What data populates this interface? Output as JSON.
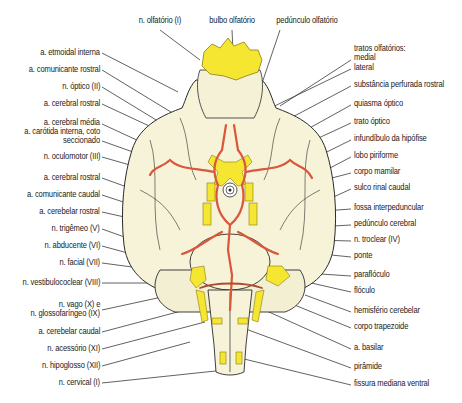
{
  "diagram": {
    "colors": {
      "brain_fill": "#f7f3d9",
      "outline": "#2a2a2a",
      "nerve_yellow": "#f5e632",
      "artery_red": "#d9573a",
      "leader_line": "#333333"
    },
    "top_labels": [
      {
        "text": "n. olfatório (I)",
        "x": 160,
        "y": 22
      },
      {
        "text": "bulbo olfatório",
        "x": 232,
        "y": 22
      },
      {
        "text": "pedúnculo olfatório",
        "x": 307,
        "y": 22
      }
    ],
    "left_labels": [
      {
        "text": "a. etmoidal interna",
        "y": 52
      },
      {
        "text": "a. comunicante rostral",
        "y": 69
      },
      {
        "text": "n. óptico (II)",
        "y": 86
      },
      {
        "text": "a. cerebral rostral",
        "y": 103
      },
      {
        "text": "a. cerebral média",
        "y": 122
      },
      {
        "text": "a. carótida interna, coto",
        "y": 131
      },
      {
        "text": "seccionado",
        "y": 140
      },
      {
        "text": "n. oculomotor (III)",
        "y": 156
      },
      {
        "text": "a. cerebral rostral",
        "y": 177
      },
      {
        "text": "a. comunicante caudal",
        "y": 194
      },
      {
        "text": "a. cerebelar rostral",
        "y": 211
      },
      {
        "text": "n. trigêmeo (V)",
        "y": 228
      },
      {
        "text": "n. abducente (VI)",
        "y": 245
      },
      {
        "text": "n. facial (VII)",
        "y": 262
      },
      {
        "text": "n. vestibulococlear (VIII)",
        "y": 282
      },
      {
        "text": "n. vago (X) e",
        "y": 304
      },
      {
        "text": "n. glossofaríngeo (IX)",
        "y": 313
      },
      {
        "text": "a. cerebelar caudal",
        "y": 331
      },
      {
        "text": "n. acessório (XI)",
        "y": 348
      },
      {
        "text": "n. hipoglosso (XII)",
        "y": 365
      },
      {
        "text": "n. cervical (I)",
        "y": 382
      }
    ],
    "right_labels": [
      {
        "text": "tratos olfatórios:",
        "y": 48
      },
      {
        "text": "medial",
        "y": 57
      },
      {
        "text": "lateral",
        "y": 67
      },
      {
        "text": "substância perfurada rostral",
        "y": 84
      },
      {
        "text": "quiasma óptico",
        "y": 103
      },
      {
        "text": "trato óptico",
        "y": 121
      },
      {
        "text": "infundíbulo da hipófise",
        "y": 138
      },
      {
        "text": "lobo piriforme",
        "y": 155
      },
      {
        "text": "corpo mamilar",
        "y": 171
      },
      {
        "text": "sulco rinal caudal",
        "y": 187
      },
      {
        "text": "fossa interpeduncular",
        "y": 207
      },
      {
        "text": "pedúnculo cerebral",
        "y": 223
      },
      {
        "text": "n. troclear (IV)",
        "y": 239
      },
      {
        "text": "ponte",
        "y": 255
      },
      {
        "text": "paraflóculo",
        "y": 274
      },
      {
        "text": "flóculo",
        "y": 290
      },
      {
        "text": "hemisfério cerebelar",
        "y": 310
      },
      {
        "text": "corpo trapezoide",
        "y": 326
      },
      {
        "text": "a. basilar",
        "y": 347
      },
      {
        "text": "pirâmide",
        "y": 366
      },
      {
        "text": "fissura mediana ventral",
        "y": 383
      }
    ]
  }
}
